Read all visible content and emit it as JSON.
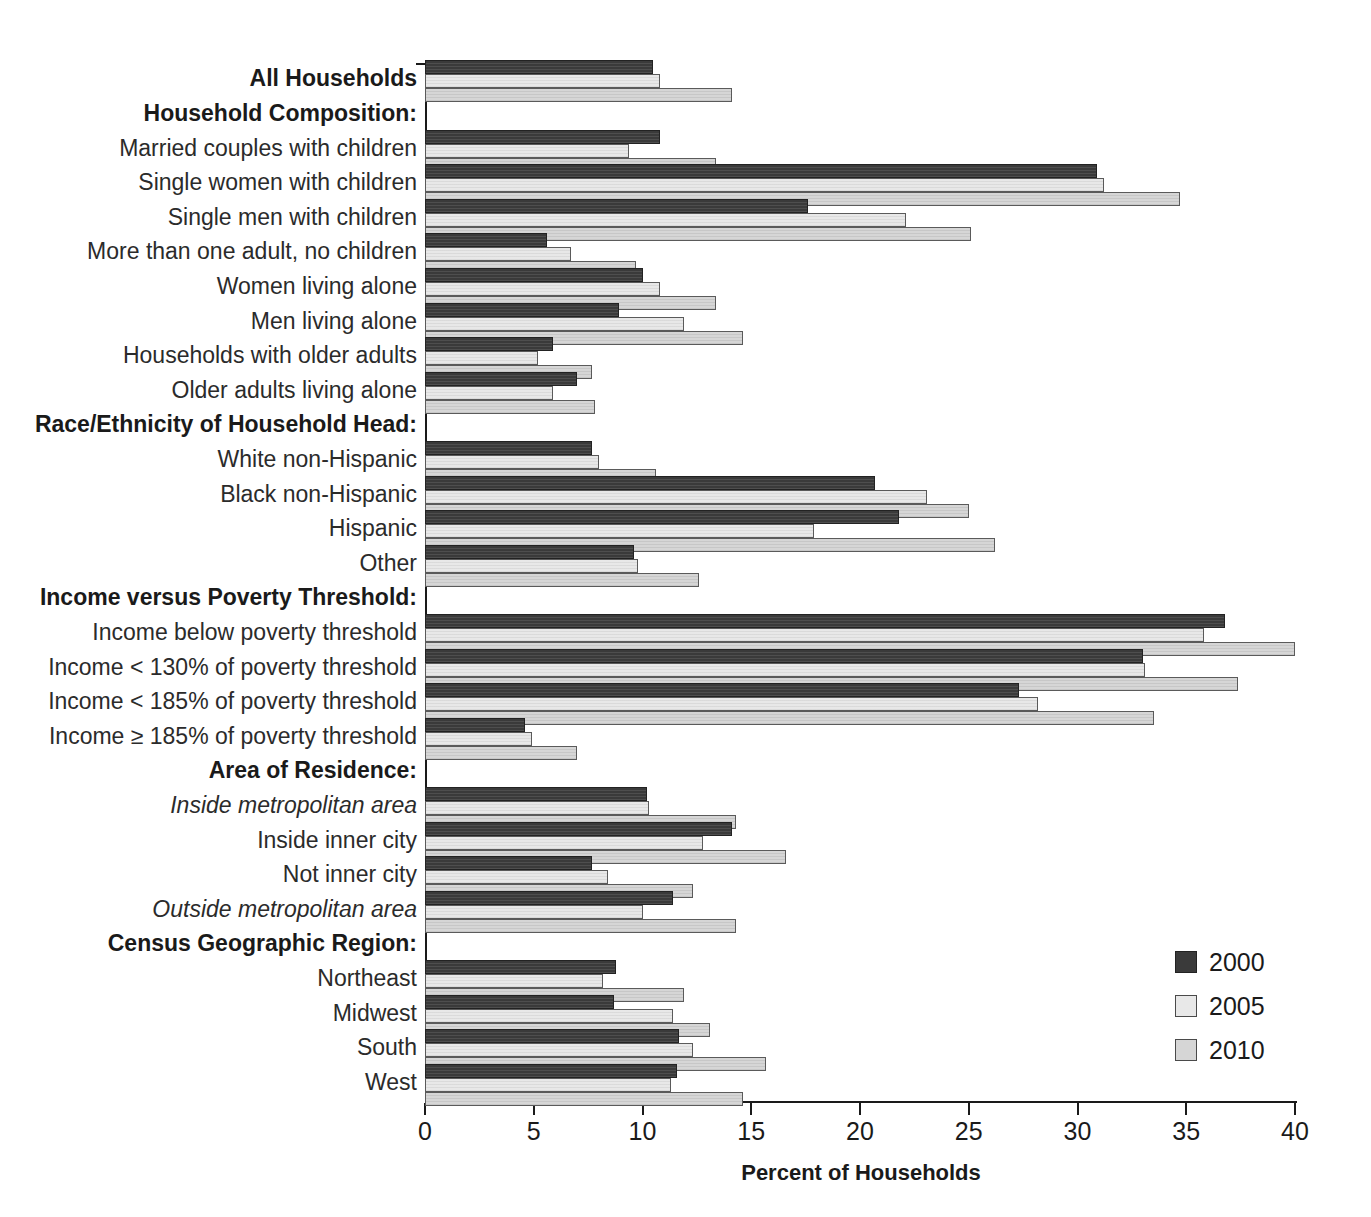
{
  "chart_data": {
    "type": "bar",
    "orientation": "horizontal",
    "title": "",
    "xlabel": "Percent of Households",
    "ylabel": "",
    "xlim": [
      0,
      40
    ],
    "xticks": [
      0,
      5,
      10,
      15,
      20,
      25,
      30,
      35,
      40
    ],
    "xtick_labels": [
      "0",
      "5",
      "10",
      "15",
      "20",
      "25",
      "30",
      "35",
      "40"
    ],
    "grid": false,
    "legend_position": "bottom-right",
    "series": [
      {
        "name": "2000",
        "color": "#3a3a3a",
        "values": [
          10.5,
          null,
          10.8,
          30.9,
          17.6,
          5.6,
          10.0,
          8.9,
          5.9,
          7.0,
          null,
          7.7,
          20.7,
          21.8,
          9.6,
          null,
          36.8,
          33.0,
          27.3,
          4.6,
          null,
          10.2,
          14.1,
          7.7,
          11.4,
          null,
          8.8,
          8.7,
          11.7,
          11.6
        ]
      },
      {
        "name": "2005",
        "color": "#e8e8e8",
        "values": [
          10.8,
          null,
          9.4,
          31.2,
          22.1,
          6.7,
          10.8,
          11.9,
          5.2,
          5.9,
          null,
          8.0,
          23.1,
          17.9,
          9.8,
          null,
          35.8,
          33.1,
          28.2,
          4.9,
          null,
          10.3,
          12.8,
          8.4,
          10.0,
          null,
          8.2,
          11.4,
          12.3,
          11.3
        ]
      },
      {
        "name": "2010",
        "color": "#d6d6d6",
        "values": [
          14.1,
          null,
          13.4,
          34.7,
          25.1,
          9.7,
          13.4,
          14.6,
          7.7,
          7.8,
          null,
          10.6,
          25.0,
          26.2,
          12.6,
          null,
          40.0,
          37.4,
          33.5,
          7.0,
          null,
          14.3,
          16.6,
          12.3,
          14.3,
          null,
          11.9,
          13.1,
          15.7,
          14.6
        ]
      }
    ],
    "categories": [
      {
        "label": "All Households",
        "style": "heading"
      },
      {
        "label": "Household Composition:",
        "style": "heading"
      },
      {
        "label": "Married couples with children",
        "style": "normal"
      },
      {
        "label": "Single women with children",
        "style": "normal"
      },
      {
        "label": "Single men with children",
        "style": "normal"
      },
      {
        "label": "More than one adult, no children",
        "style": "normal"
      },
      {
        "label": "Women living alone",
        "style": "normal"
      },
      {
        "label": "Men living alone",
        "style": "normal"
      },
      {
        "label": "Households with older adults",
        "style": "normal"
      },
      {
        "label": "Older adults living alone",
        "style": "normal"
      },
      {
        "label": "Race/Ethnicity of Household Head:",
        "style": "heading"
      },
      {
        "label": "White non-Hispanic",
        "style": "normal"
      },
      {
        "label": "Black non-Hispanic",
        "style": "normal"
      },
      {
        "label": "Hispanic",
        "style": "normal"
      },
      {
        "label": "Other",
        "style": "normal"
      },
      {
        "label": "Income versus Poverty Threshold:",
        "style": "heading"
      },
      {
        "label": "Income below poverty threshold",
        "style": "normal"
      },
      {
        "label": "Income < 130% of poverty threshold",
        "style": "normal"
      },
      {
        "label": "Income < 185% of poverty threshold",
        "style": "normal"
      },
      {
        "label": "Income ≥ 185% of poverty threshold",
        "style": "normal"
      },
      {
        "label": "Area of Residence:",
        "style": "heading"
      },
      {
        "label": "Inside metropolitan area",
        "style": "italic"
      },
      {
        "label": "Inside inner city",
        "style": "normal"
      },
      {
        "label": "Not inner city",
        "style": "normal"
      },
      {
        "label": "Outside metropolitan area",
        "style": "italic"
      },
      {
        "label": "Census Geographic Region:",
        "style": "heading"
      },
      {
        "label": "Northeast",
        "style": "normal"
      },
      {
        "label": "Midwest",
        "style": "normal"
      },
      {
        "label": "South",
        "style": "normal"
      },
      {
        "label": "West",
        "style": "normal"
      }
    ]
  },
  "legend": {
    "items": [
      {
        "label": "2000",
        "key": "y2000"
      },
      {
        "label": "2005",
        "key": "y2005"
      },
      {
        "label": "2010",
        "key": "y2010"
      }
    ]
  }
}
